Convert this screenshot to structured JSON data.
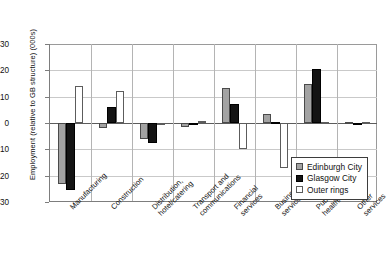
{
  "chart_data": {
    "type": "bar",
    "title": "",
    "xlabel": "",
    "ylabel": "Employment (relative to GB structure) (000s)",
    "ylim": [
      -30,
      30
    ],
    "ytick_labels": [
      "30",
      "20",
      "10",
      "0",
      "-10",
      "-20",
      "-30"
    ],
    "ytick_values": [
      30,
      20,
      10,
      0,
      -10,
      -20,
      -30
    ],
    "grid": true,
    "legend_position": "bottom-right",
    "categories": [
      "Manufacturing",
      "Construction",
      "Distribution, hotel/catering",
      "Transport and communications",
      "Financial services",
      "Business services",
      "Public services, health/education",
      "Other services"
    ],
    "category_lines": [
      [
        "Manufacturing"
      ],
      [
        "Construction"
      ],
      [
        "Distribution,",
        "hotel/catering"
      ],
      [
        "Transport and",
        "communications"
      ],
      [
        "Financial",
        "services"
      ],
      [
        "Business",
        "services"
      ],
      [
        "Public services,",
        "health/education"
      ],
      [
        "Other",
        "services"
      ]
    ],
    "series": [
      {
        "name": "Edinburgh City",
        "color": "#a3a3a3",
        "values": [
          -23.0,
          -1.8,
          -6.0,
          -1.6,
          13.3,
          3.3,
          14.8,
          0.3
        ]
      },
      {
        "name": "Glasgow City",
        "color": "#141414",
        "values": [
          -25.6,
          6.0,
          -7.6,
          -0.9,
          7.2,
          0.3,
          20.5,
          -0.3
        ]
      },
      {
        "name": "Outer rings",
        "color": "#ffffff",
        "values": [
          14.0,
          12.1,
          -0.7,
          0.7,
          -9.9,
          -17.2,
          0.3,
          0.4
        ]
      }
    ]
  },
  "legend": {
    "items": [
      {
        "label": "Edinburgh City",
        "key": "edinburgh"
      },
      {
        "label": "Glasgow City",
        "key": "glasgow"
      },
      {
        "label": "Outer rings",
        "key": "outer"
      }
    ]
  }
}
